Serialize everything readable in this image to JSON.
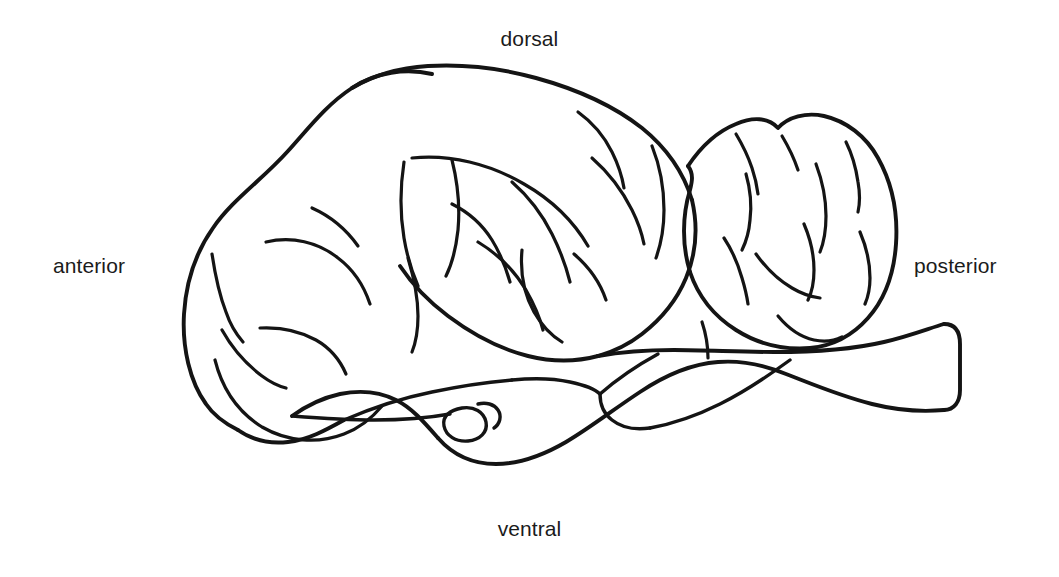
{
  "figure": {
    "kind": "anatomical-line-diagram",
    "background_color": "#ffffff",
    "line_color": "#141414",
    "text_color": "#1b1b1b"
  },
  "labels": {
    "dorsal": "dorsal",
    "ventral": "ventral",
    "anterior": "anterior",
    "posterior": "posterior"
  },
  "diagram": {
    "regions": [
      {
        "name": "anterior-lobe",
        "description": "rounded anterior lobe (olfactory / telencephalon)"
      },
      {
        "name": "central-lobe",
        "description": "large central lobe (optic tectum / cerebrum) with longitudinal sulci"
      },
      {
        "name": "posterior-lobe",
        "description": "bilobed posterior mass (cerebellum)"
      },
      {
        "name": "brainstem",
        "description": "ventral brainstem extending posteriorly to a blunt cut end (spinal cord)"
      },
      {
        "name": "pituitary",
        "description": "small oval body on the ventral surface"
      }
    ],
    "paths": {
      "anterior_lobe_outline": "M 432 74 C 406 68 376 72 352 88 C 326 105 308 129 288 151 C 262 180 232 200 213 228 C 196 252 186 282 184 314 C 182 348 190 382 206 404 C 214 416 226 424 238 430",
      "ventral_anterior_edge": "M 238 430 C 252 440 270 444 288 442 C 308 440 326 430 344 420",
      "anterior_sulcus_1": "M 212 254 C 215 274 219 294 226 312 C 230 324 236 334 243 342",
      "anterior_sulcus_2": "M 222 330 C 232 348 246 364 262 376 C 270 382 278 386 286 388",
      "anterior_sulcus_3": "M 260 328 C 280 327 300 331 316 340 C 330 348 340 360 346 374",
      "anterior_sulcus_4": "M 215 360 C 222 388 238 412 262 427 C 288 442 318 444 344 434 C 360 428 372 418 382 406",
      "anterior_sulcus_5": "M 266 242 C 292 236 318 242 338 258 C 354 270 364 286 370 304",
      "anterior_sulcus_6": "M 312 208 C 330 216 346 229 358 246",
      "central_top_outline": "M 352 88 C 372 76 398 68 428 66 C 462 64 500 68 536 78 C 576 89 614 106 642 128 C 668 149 684 174 692 200",
      "central_right_outline": "M 692 200 C 698 226 696 254 686 278 C 676 302 660 320 642 334 C 628 345 612 352 598 356",
      "central_bottom_outline": "M 598 356 C 576 362 552 362 528 356 C 500 349 472 334 448 316 C 428 301 412 284 400 266",
      "central_sulcus_long": "M 412 158 C 450 154 490 164 524 184 C 552 200 574 222 588 246",
      "central_sulcus_2": "M 578 112 C 592 122 604 136 612 152 C 618 164 622 176 624 188",
      "central_sulcus_3": "M 592 158 C 608 172 622 190 632 210 C 638 222 642 234 644 244",
      "central_sulcus_4": "M 652 146 C 660 166 664 188 664 210 C 664 228 661 244 656 258",
      "central_sulcus_5": "M 404 162 C 400 188 400 214 404 238 C 407 256 412 272 418 286",
      "central_sulcus_6": "M 452 160 C 458 184 460 208 458 230 C 456 248 452 264 446 276",
      "central_sulcus_7": "M 512 182 C 528 196 542 214 552 234 C 560 250 566 266 570 282",
      "central_sulcus_8": "M 452 204 C 468 212 482 224 492 240 C 500 253 506 268 510 282",
      "central_sulcus_9": "M 478 242 C 498 254 514 270 526 290 C 534 304 540 318 543 330",
      "central_sulcus_10": "M 408 258 C 414 278 418 298 418 316 C 418 330 416 342 412 352",
      "central_sulcus_11": "M 522 250 C 520 272 524 294 534 312 C 542 326 552 336 562 342",
      "central_sulcus_12": "M 574 254 C 588 266 600 282 606 300",
      "posterior_lobe_outline": "M 688 166 C 700 148 716 132 736 124 C 752 117 768 117 778 128 C 788 117 806 112 824 116 C 846 121 866 136 878 158 C 892 183 898 214 896 244 C 894 274 884 300 868 318 C 852 336 832 346 810 348 C 784 350 758 344 736 330 C 714 316 698 296 690 272",
      "posterior_left_inner": "M 690 272 C 682 246 682 216 690 190 C 692 182 694 174 688 166",
      "posterior_sulcus_1": "M 736 134 C 742 144 748 156 752 168 C 755 177 757 186 758 194",
      "posterior_sulcus_2": "M 782 136 C 788 146 794 158 798 170",
      "posterior_sulcus_3": "M 846 142 C 852 154 856 168 858 182 C 860 193 860 203 858 212",
      "posterior_sulcus_4": "M 746 174 C 750 188 752 204 750 220 C 749 232 746 242 742 250",
      "posterior_sulcus_5": "M 816 164 C 822 180 826 198 826 216 C 826 230 824 242 820 252",
      "posterior_sulcus_6": "M 804 224 C 810 238 814 254 814 270 C 814 282 812 292 808 300",
      "posterior_sulcus_7": "M 860 232 C 866 246 870 262 870 278 C 870 288 868 297 865 304",
      "posterior_sulcus_8": "M 724 238 C 732 250 738 264 742 278 C 745 288 747 297 748 304",
      "posterior_sulcus_9": "M 756 254 C 766 268 778 280 792 288 C 802 294 812 297 820 298",
      "posterior_sulcus_10": "M 778 316 C 788 328 800 337 814 340 C 824 342 834 341 842 337",
      "posterior_sulcus_11": "M 702 322 C 706 334 708 346 708 358",
      "ventral_brainstem_top": "M 598 356 C 620 352 646 350 674 350 C 706 350 740 352 774 352 C 812 352 850 350 884 342 C 910 336 930 328 944 324",
      "ventral_brainstem_right_end": "M 944 324 C 954 324 960 330 960 344 L 960 390 C 960 402 954 410 944 410",
      "ventral_brainstem_bottom": "M 944 410 C 922 412 896 410 872 404 C 840 396 812 384 786 374 C 764 365 742 360 718 362 C 690 364 664 376 640 392 C 614 409 590 428 566 442 C 542 456 518 464 496 464 C 472 464 452 454 438 438",
      "ventral_lower_left": "M 438 438 C 424 422 412 408 396 400 C 380 392 360 390 340 394 C 322 398 306 406 292 416",
      "ventral_inner_groove_upper": "M 790 360 C 768 376 744 392 720 404 C 696 416 672 424 650 428",
      "ventral_inner_groove_lower": "M 650 428 C 636 430 622 428 612 420 C 604 414 600 404 600 394",
      "ventral_inner_groove_tail": "M 600 394 C 616 380 636 366 658 354",
      "optic_tract_upper": "M 344 420 C 372 408 402 398 432 392 C 460 386 488 382 512 380",
      "optic_tract_lower": "M 292 416 C 318 418 346 420 374 420 C 402 420 428 418 450 414",
      "pituitary_oval": "M 462 408 C 474 406 484 412 486 422 C 488 432 480 440 468 441 C 456 442 446 436 444 426 C 442 416 450 410 462 408",
      "pituitary_stalk": "M 478 404 C 486 402 494 404 498 410 C 502 416 500 424 494 428",
      "ventral_mid_dip": "M 512 380 C 532 378 552 378 570 382 C 584 385 596 390 600 394"
    }
  }
}
